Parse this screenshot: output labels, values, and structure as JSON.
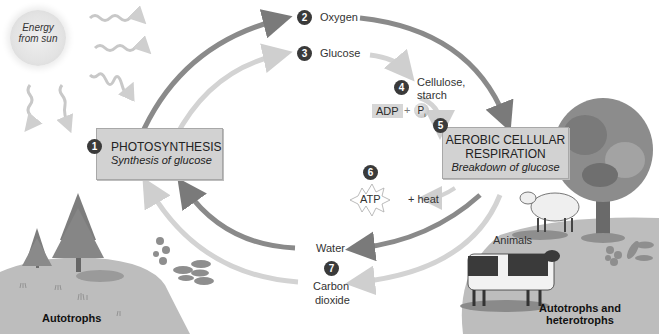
{
  "diagram": {
    "sun": {
      "line1": "Energy",
      "line2": "from sun"
    },
    "steps": [
      {
        "number": "1",
        "title": "PHOTOSYNTHESIS",
        "subtitle": "Synthesis of glucose"
      },
      {
        "number": "2",
        "label": "Oxygen"
      },
      {
        "number": "3",
        "label": "Glucose"
      },
      {
        "number": "4",
        "label_line1": "Cellulose,",
        "label_line2": "starch"
      },
      {
        "number": "5",
        "title_line1": "AEROBIC CELLULAR",
        "title_line2": "RESPIRATION",
        "subtitle": "Breakdown of glucose"
      },
      {
        "number": "6",
        "atp": "ATP",
        "plus_heat": "+ heat"
      },
      {
        "number": "7",
        "water": "Water",
        "co2_line1": "Carbon",
        "co2_line2": "dioxide"
      }
    ],
    "adp": {
      "adp": "ADP",
      "plus": "+",
      "pi": "P",
      "pi_sub": "i"
    },
    "labels": {
      "animals": "Animals",
      "autotrophs": "Autotrophs",
      "auto_hetero_line1": "Autotrophs and",
      "auto_hetero_line2": "heterotrophs"
    },
    "colors": {
      "arrow_dark": "#7a7a7a",
      "arrow_mid": "#9a9a9a",
      "arrow_light": "#cfcfcf",
      "box_fill": "#d2d2d2",
      "badge": "#3a3a3a",
      "ground": "#bdbdbd"
    }
  }
}
